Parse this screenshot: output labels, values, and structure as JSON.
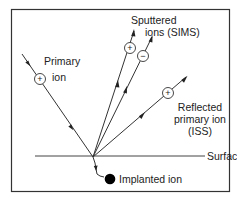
{
  "diagram": {
    "labels": {
      "primary_ion": [
        "Primary",
        "ion"
      ],
      "sputtered_ions": [
        "Sputtered",
        "ions (SIMS)"
      ],
      "reflected_ion": [
        "Reflected",
        "primary ion",
        "(ISS)"
      ],
      "surface": "Surface",
      "implanted_ion": "Implanted ion"
    },
    "charges": {
      "primary": "+",
      "sputtered_positive": "+",
      "sputtered_negative": "−",
      "reflected": "+"
    },
    "colors": {
      "line": "#333333",
      "frame": "#333333",
      "ion_fill": "#000000",
      "background": "#ffffff"
    }
  }
}
